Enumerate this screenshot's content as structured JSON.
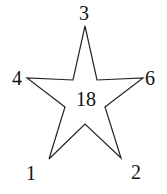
{
  "diagram": {
    "shape": "five-pointed star",
    "center_value": "18",
    "labels": {
      "top": "3",
      "left": "4",
      "right": "6",
      "bottom_left": "1",
      "bottom_right": "2"
    },
    "stroke_color": "#222222",
    "fill_color": "#ffffff"
  }
}
